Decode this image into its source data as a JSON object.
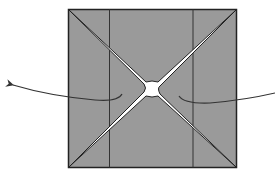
{
  "diagram": {
    "type": "origami-fold-diagram",
    "colors": {
      "paper_fill": "#9a9a9a",
      "outline": "#222222",
      "slit_fill": "#ffffff",
      "arrow": "#333333"
    },
    "square": {
      "x": 68,
      "y": 9,
      "width": 169,
      "height": 159
    },
    "crease_lines_x": [
      109,
      193
    ],
    "center": {
      "x": 152,
      "y": 88
    },
    "arrows": [
      {
        "name": "pull-left-arrow",
        "direction": "left"
      },
      {
        "name": "pull-right-arrow",
        "direction": "right"
      }
    ]
  }
}
